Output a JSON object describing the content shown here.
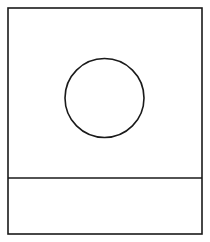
{
  "diagram": {
    "canvas": {
      "width": 210,
      "height": 242,
      "background": "#ffffff"
    },
    "stroke_color": "#1a1a1a",
    "stroke_width": 1.6,
    "outer_frame": {
      "x": 8,
      "y": 8,
      "width": 194,
      "height": 226
    },
    "divider": {
      "x1": 8,
      "y1": 178,
      "x2": 202,
      "y2": 178
    },
    "circle": {
      "cx": 104.5,
      "cy": 98,
      "r": 39.5
    },
    "labels": []
  }
}
